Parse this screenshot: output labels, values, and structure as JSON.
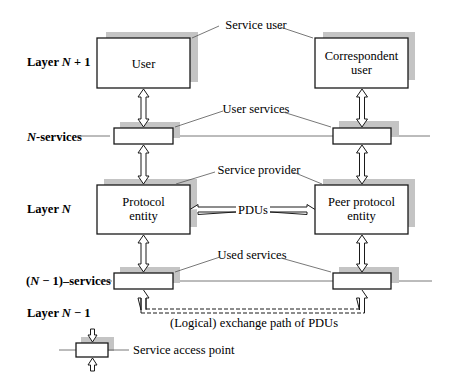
{
  "diagram": {
    "layers": [
      {
        "id": "layer-n-plus-1",
        "label_prefix": "Layer ",
        "label_var": "N",
        "label_suffix": " + 1"
      },
      {
        "id": "layer-n",
        "label_prefix": "Layer ",
        "label_var": "N",
        "label_suffix": ""
      },
      {
        "id": "layer-n-minus-1",
        "label_prefix": "Layer ",
        "label_var": "N",
        "label_suffix": " − 1"
      }
    ],
    "service_lines": {
      "n_services": {
        "var": "N",
        "suffix": "-services"
      },
      "n_minus_1_services": {
        "prefix": "(",
        "var": "N",
        "suffix": " − 1)–services"
      }
    },
    "boxes": {
      "user": {
        "line1": "User",
        "line2": ""
      },
      "correspondent_user": {
        "line1": "Correspondent",
        "line2": "user"
      },
      "protocol_entity": {
        "line1": "Protocol",
        "line2": "entity"
      },
      "peer_protocol_entity": {
        "line1": "Peer protocol",
        "line2": "entity"
      }
    },
    "annotations": {
      "service_user": "Service user",
      "user_services": "User services",
      "service_provider": "Service provider",
      "pdus": "PDUs",
      "used_services": "Used services",
      "logical_path": "(Logical) exchange path of PDUs"
    },
    "legend": {
      "service_access_point": "Service access point"
    },
    "colors": {
      "stroke": "#1a1a1a",
      "shadow": "#c4c4c4",
      "thin_line": "#555555",
      "background": "#ffffff"
    }
  }
}
